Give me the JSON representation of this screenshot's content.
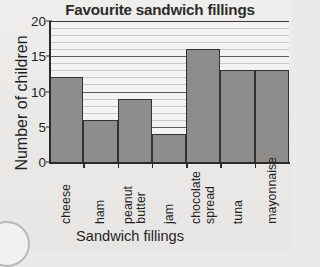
{
  "chart_data": {
    "type": "bar",
    "title": "Favourite sandwich fillings",
    "xlabel": "Sandwich fillings",
    "ylabel": "Number of children",
    "categories": [
      "cheese",
      "ham",
      "peanut butter",
      "jam",
      "chocolate spread",
      "tuna",
      "mayonnaise"
    ],
    "category_lines": [
      [
        "cheese"
      ],
      [
        "ham"
      ],
      [
        "peanut",
        "butter"
      ],
      [
        "jam"
      ],
      [
        "chocolate",
        "spread"
      ],
      [
        "tuna"
      ],
      [
        "mayonnaise"
      ]
    ],
    "values": [
      12,
      6,
      9,
      4,
      16,
      13,
      13
    ],
    "ylim": [
      0,
      20
    ],
    "ytick_labels": [
      "0",
      "5",
      "10",
      "15",
      "20"
    ],
    "ytick_values": [
      0,
      5,
      10,
      15,
      20
    ],
    "minor_gridline_step": 1,
    "grid": true,
    "legend": null,
    "bar_color": "#8e8d8b",
    "bar_edge_color": "#333230",
    "axis_color": "#2a2a2a",
    "gridline_color": "#c9c8c6",
    "major_gridline_color": "#5d5c5a",
    "plot_background": "#f4f3f1",
    "page_background": "#ebeae8"
  }
}
